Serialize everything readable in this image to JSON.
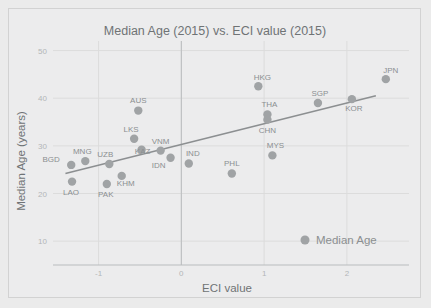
{
  "chart_data": {
    "type": "scatter",
    "title": "Median Age (2015) vs. ECI value (2015)",
    "xlabel": "ECI value",
    "ylabel": "Median Age (years)",
    "xlim": [
      -1.55,
      2.75
    ],
    "ylim": [
      5,
      52
    ],
    "xticks": [
      -1,
      0,
      1,
      2
    ],
    "xtick_labels": [
      "-1",
      "0",
      "1",
      "2"
    ],
    "yticks": [
      10,
      20,
      30,
      40,
      50
    ],
    "ytick_labels": [
      "10",
      "20",
      "30",
      "40",
      "50"
    ],
    "grid": true,
    "legend": {
      "position": "bottom-right",
      "entries": [
        "Median Age"
      ]
    },
    "series": [
      {
        "name": "Median Age",
        "marker_color": "#a0a3a5",
        "points": [
          {
            "label": "BGD",
            "x": -1.33,
            "y": 26.0,
            "label_dx": -20,
            "label_dy": -3
          },
          {
            "label": "LAO",
            "x": -1.32,
            "y": 22.5,
            "label_dx": -1,
            "label_dy": 13
          },
          {
            "label": "MNG",
            "x": -1.16,
            "y": 26.8,
            "label_dx": -3,
            "label_dy": -7
          },
          {
            "label": "UZB",
            "x": -0.87,
            "y": 26.2,
            "label_dx": -4,
            "label_dy": -7
          },
          {
            "label": "PAK",
            "x": -0.9,
            "y": 22.0,
            "label_dx": -1,
            "label_dy": 13
          },
          {
            "label": "KHM",
            "x": -0.72,
            "y": 23.7,
            "label_dx": 4,
            "label_dy": 10
          },
          {
            "label": "AUS",
            "x": -0.52,
            "y": 37.4,
            "label_dx": 0,
            "label_dy": -8
          },
          {
            "label": "LKS",
            "x": -0.57,
            "y": 31.5,
            "label_dx": -3,
            "label_dy": -7
          },
          {
            "label": "KAZ",
            "x": -0.48,
            "y": 29.2,
            "label_dx": 1,
            "label_dy": 4
          },
          {
            "label": "VNM",
            "x": -0.25,
            "y": 29.0,
            "label_dx": 0,
            "label_dy": -7
          },
          {
            "label": "IDN",
            "x": -0.13,
            "y": 27.5,
            "label_dx": -12,
            "label_dy": 10
          },
          {
            "label": "IND",
            "x": 0.09,
            "y": 26.3,
            "label_dx": 4,
            "label_dy": -7
          },
          {
            "label": "PHL",
            "x": 0.61,
            "y": 24.2,
            "label_dx": 0,
            "label_dy": -7
          },
          {
            "label": "MYS",
            "x": 1.1,
            "y": 28.0,
            "label_dx": 3,
            "label_dy": -7
          },
          {
            "label": "HKG",
            "x": 0.93,
            "y": 42.5,
            "label_dx": 4,
            "label_dy": -6
          },
          {
            "label": "THA",
            "x": 1.04,
            "y": 36.6,
            "label_dx": 2,
            "label_dy": -7
          },
          {
            "label": "CHN",
            "x": 1.04,
            "y": 35.5,
            "label_dx": 0,
            "label_dy": 13
          },
          {
            "label": "SGP",
            "x": 1.65,
            "y": 39.0,
            "label_dx": 2,
            "label_dy": -7
          },
          {
            "label": "KOR",
            "x": 2.06,
            "y": 39.8,
            "label_dx": 2,
            "label_dy": 12
          },
          {
            "label": "JPN",
            "x": 2.47,
            "y": 44.0,
            "label_dx": 5,
            "label_dy": -6
          }
        ]
      }
    ],
    "trendline": {
      "x0": -1.4,
      "y0": 24.2,
      "x1": 2.35,
      "y1": 40.5,
      "color": "#8c8f91"
    }
  },
  "colors": {
    "background": "#ececed",
    "marker": "#a0a3a5",
    "trendline": "#8c8f91",
    "grid": "#dcdcdc",
    "text": "#6f7375",
    "tick_text": "#b3b6b8"
  }
}
